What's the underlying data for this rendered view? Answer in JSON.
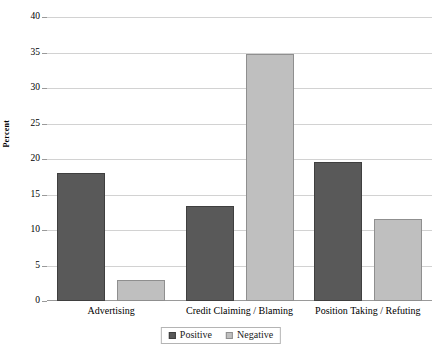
{
  "chart_data": {
    "type": "bar",
    "title": "",
    "xlabel": "",
    "ylabel": "Percent",
    "ylim": [
      0,
      40
    ],
    "yticks": [
      0,
      5,
      10,
      15,
      20,
      25,
      30,
      35,
      40
    ],
    "ytick_labels": [
      "0",
      "5",
      "10",
      "15",
      "20",
      "25",
      "30",
      "35",
      "40"
    ],
    "grid": true,
    "legend_position": "bottom-center",
    "categories": [
      "Advertising",
      "Credit Claiming / Blaming",
      "Position Taking / Refuting"
    ],
    "series": [
      {
        "name": "Positive",
        "color": "#595959",
        "values": [
          18.1,
          13.4,
          19.6
        ]
      },
      {
        "name": "Negative",
        "color": "#bfbfbf",
        "values": [
          3.0,
          34.8,
          11.6
        ]
      }
    ]
  },
  "legend": {
    "items": [
      {
        "label": "Positive",
        "swatch": "legend-swatch-positive"
      },
      {
        "label": "Negative",
        "swatch": "legend-swatch-negative"
      }
    ]
  },
  "axes": {
    "y_title": "Percent"
  }
}
